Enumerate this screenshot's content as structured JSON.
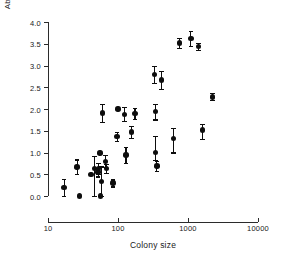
{
  "chart_data": {
    "type": "scatter",
    "title": "",
    "xlabel": "Colony size",
    "ylabel": "Abutting neighbouring nests / nest",
    "xscale": "log",
    "yscale": "linear",
    "xlim": [
      10,
      10000
    ],
    "ylim": [
      0.0,
      4.0
    ],
    "grid": false,
    "legend": false,
    "xticks": [
      10,
      100,
      1000,
      10000
    ],
    "xtick_labels": [
      "10",
      "100",
      "1000",
      "10000"
    ],
    "yticks": [
      0.0,
      0.5,
      1.0,
      1.5,
      2.0,
      2.5,
      3.0,
      3.5,
      4.0
    ],
    "ytick_labels": [
      "0.0",
      "0.5",
      "1.0",
      "1.5",
      "2.0",
      "2.5",
      "3.0",
      "3.5",
      "4.0"
    ],
    "marker": "filled-circle",
    "marker_color": "#0d0d0d",
    "error_bars": "vertical",
    "n_points": 30,
    "points": [
      {
        "x": 17,
        "y": 0.2,
        "yerr_low": 0.2,
        "yerr_high": 0.2
      },
      {
        "x": 26,
        "y": 0.67,
        "yerr_low": 0.17,
        "yerr_high": 0.17
      },
      {
        "x": 28,
        "y": 0.0,
        "yerr_low": 0.0,
        "yerr_high": 0.0
      },
      {
        "x": 41,
        "y": 0.5,
        "yerr_low": 0.0,
        "yerr_high": 0.0
      },
      {
        "x": 46,
        "y": 0.63,
        "yerr_low": 0.63,
        "yerr_high": 0.3
      },
      {
        "x": 52,
        "y": 0.55,
        "yerr_low": 0.1,
        "yerr_high": 0.1
      },
      {
        "x": 53,
        "y": 0.63,
        "yerr_low": 0.12,
        "yerr_high": 0.12
      },
      {
        "x": 55,
        "y": 0.99,
        "yerr_low": 0.0,
        "yerr_high": 0.0
      },
      {
        "x": 56,
        "y": 0.0,
        "yerr_low": 0.0,
        "yerr_high": 0.0
      },
      {
        "x": 58,
        "y": 0.34,
        "yerr_low": 0.34,
        "yerr_high": 0.34
      },
      {
        "x": 60,
        "y": 1.91,
        "yerr_low": 0.21,
        "yerr_high": 0.21
      },
      {
        "x": 66,
        "y": 0.8,
        "yerr_low": 0.14,
        "yerr_high": 0.14
      },
      {
        "x": 68,
        "y": 0.63,
        "yerr_low": 0.1,
        "yerr_high": 0.1
      },
      {
        "x": 85,
        "y": 0.3,
        "yerr_low": 0.08,
        "yerr_high": 0.08
      },
      {
        "x": 97,
        "y": 1.37,
        "yerr_low": 0.1,
        "yerr_high": 0.1
      },
      {
        "x": 100,
        "y": 2.0,
        "yerr_low": 0.0,
        "yerr_high": 0.0
      },
      {
        "x": 125,
        "y": 1.88,
        "yerr_low": 0.16,
        "yerr_high": 0.16
      },
      {
        "x": 130,
        "y": 0.94,
        "yerr_low": 0.18,
        "yerr_high": 0.18
      },
      {
        "x": 155,
        "y": 1.47,
        "yerr_low": 0.14,
        "yerr_high": 0.14
      },
      {
        "x": 175,
        "y": 1.9,
        "yerr_low": 0.12,
        "yerr_high": 0.12
      },
      {
        "x": 330,
        "y": 2.8,
        "yerr_low": 0.2,
        "yerr_high": 0.2
      },
      {
        "x": 340,
        "y": 1.94,
        "yerr_low": 0.18,
        "yerr_high": 0.18
      },
      {
        "x": 345,
        "y": 1.0,
        "yerr_low": 0.18,
        "yerr_high": 0.38
      },
      {
        "x": 360,
        "y": 0.69,
        "yerr_low": 0.12,
        "yerr_high": 0.12
      },
      {
        "x": 420,
        "y": 2.67,
        "yerr_low": 0.2,
        "yerr_high": 0.2
      },
      {
        "x": 620,
        "y": 1.32,
        "yerr_low": 0.32,
        "yerr_high": 0.24
      },
      {
        "x": 760,
        "y": 3.52,
        "yerr_low": 0.12,
        "yerr_high": 0.12
      },
      {
        "x": 1100,
        "y": 3.62,
        "yerr_low": 0.18,
        "yerr_high": 0.18
      },
      {
        "x": 1400,
        "y": 3.43,
        "yerr_low": 0.08,
        "yerr_high": 0.08
      },
      {
        "x": 1600,
        "y": 1.52,
        "yerr_low": 0.2,
        "yerr_high": 0.14
      },
      {
        "x": 2250,
        "y": 2.28,
        "yerr_low": 0.08,
        "yerr_high": 0.08
      }
    ]
  }
}
